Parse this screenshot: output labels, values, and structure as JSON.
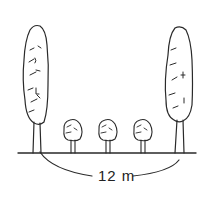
{
  "diagram": {
    "type": "tree-spacing-illustration",
    "measurement_label": "12 m",
    "elements": [
      {
        "name": "tall-tree-left",
        "kind": "columnar tree"
      },
      {
        "name": "small-tree-1",
        "kind": "small round tree"
      },
      {
        "name": "small-tree-2",
        "kind": "small round tree"
      },
      {
        "name": "small-tree-3",
        "kind": "small round tree"
      },
      {
        "name": "tall-tree-right",
        "kind": "columnar tree"
      }
    ],
    "colors": {
      "ink": "#2a2a2a",
      "background": "#ffffff"
    }
  }
}
